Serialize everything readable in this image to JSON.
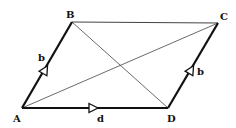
{
  "diagram": {
    "type": "parallelogram-vectors",
    "vertices": {
      "A": {
        "label": "A",
        "x": 22,
        "y": 108
      },
      "B": {
        "label": "B",
        "x": 72,
        "y": 22
      },
      "C": {
        "label": "C",
        "x": 218,
        "y": 23
      },
      "D": {
        "label": "D",
        "x": 168,
        "y": 108
      }
    },
    "edges": [
      {
        "from": "A",
        "to": "B",
        "label": "b",
        "vector": true,
        "weight": "thick"
      },
      {
        "from": "A",
        "to": "D",
        "label": "d",
        "vector": true,
        "weight": "thick"
      },
      {
        "from": "D",
        "to": "C",
        "label": "b",
        "vector": true,
        "weight": "thick"
      },
      {
        "from": "B",
        "to": "C",
        "label": "",
        "vector": false,
        "weight": "thin"
      }
    ],
    "diagonals": [
      {
        "from": "A",
        "to": "C"
      },
      {
        "from": "B",
        "to": "D"
      }
    ],
    "labels": {
      "A": "A",
      "B": "B",
      "C": "C",
      "D": "D",
      "edge_AB": "b",
      "edge_AD": "d",
      "edge_DC": "b"
    },
    "colors": {
      "line": "#111111",
      "thin_line": "#444444",
      "background": "#ffffff"
    }
  }
}
